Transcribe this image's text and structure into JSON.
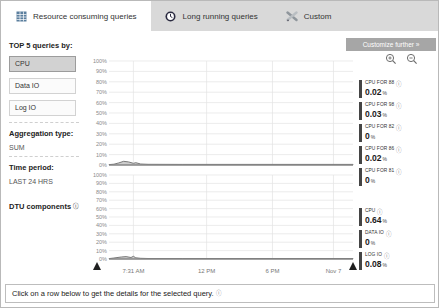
{
  "tabs": [
    {
      "label": "Resource consuming queries",
      "icon": "grid-icon",
      "active": true
    },
    {
      "label": "Long running queries",
      "icon": "clock-icon",
      "active": false
    },
    {
      "label": "Custom",
      "icon": "tools-icon",
      "active": false
    }
  ],
  "toolbar": {
    "customize_label": "Customize further »",
    "zoom_in_icon": "zoom-in-magnifier",
    "zoom_out_icon": "zoom-out-magnifier"
  },
  "sidebar": {
    "top5_label": "TOP 5 queries by:",
    "metric_buttons": [
      {
        "label": "CPU",
        "selected": true
      },
      {
        "label": "Data IO",
        "selected": false
      },
      {
        "label": "Log IO",
        "selected": false
      }
    ],
    "aggregation_label": "Aggregation type:",
    "aggregation_value": "SUM",
    "time_period_label": "Time period:",
    "time_period_value": "LAST 24 HRS",
    "dtu_label": "DTU components"
  },
  "legend_top": [
    {
      "name": "CPU FOR 88",
      "value": "0.02",
      "unit": "%"
    },
    {
      "name": "CPU FOR 98",
      "value": "0.03",
      "unit": "%"
    },
    {
      "name": "CPU FOR 82",
      "value": "0",
      "unit": "%"
    },
    {
      "name": "CPU FOR 86",
      "value": "0.02",
      "unit": "%"
    },
    {
      "name": "CPU FOR 81",
      "value": "0",
      "unit": "%"
    }
  ],
  "legend_bottom": [
    {
      "name": "CPU",
      "value": "0.64",
      "unit": "%"
    },
    {
      "name": "DATA IO",
      "value": "0",
      "unit": "%"
    },
    {
      "name": "LOG IO",
      "value": "0.08",
      "unit": "%"
    }
  ],
  "footer": {
    "message": "Click on a row below to get the details for the selected query."
  },
  "colors": {
    "tab_strip": "#d9d9d9",
    "selected_button": "#d2d2d2",
    "customize_button": "#a6a6a6",
    "legend_bar": "#454545",
    "chart_area_fill": "#cccccc",
    "chart_line": "#6e6e6e",
    "gridline": "#e4e4e4"
  },
  "chart_data": [
    {
      "type": "area",
      "title": "Top 5 queries by CPU (aggregated %, last 24 hrs)",
      "ylabel": "%",
      "ylim": [
        0,
        100
      ],
      "grid": true,
      "legend_position": "right",
      "y_ticks": [
        "100%",
        "90%",
        "80%",
        "70%",
        "60%",
        "50%",
        "40%",
        "30%",
        "20%",
        "10%",
        "0%"
      ],
      "x_ticks": [
        "7:31 AM",
        "12 PM",
        "6 PM",
        "Nov 7"
      ],
      "x_tick_fractions": [
        0.1,
        0.4,
        0.67,
        0.92
      ],
      "series": [
        {
          "name": "CPU FOR 88",
          "total_pct": 0.02
        },
        {
          "name": "CPU FOR 98",
          "total_pct": 0.03
        },
        {
          "name": "CPU FOR 82",
          "total_pct": 0
        },
        {
          "name": "CPU FOR 86",
          "total_pct": 0.02
        },
        {
          "name": "CPU FOR 81",
          "total_pct": 0
        }
      ],
      "profile_x": [
        0,
        0.02,
        0.04,
        0.06,
        0.08,
        0.1,
        0.11,
        0.13,
        0.16,
        0.3,
        1
      ],
      "profile_y": [
        0.4,
        0.8,
        2.0,
        3.6,
        3.0,
        1.6,
        2.2,
        1.0,
        0.7,
        0.6,
        0.6
      ]
    },
    {
      "type": "area",
      "title": "DTU components (%)",
      "ylabel": "%",
      "ylim": [
        0,
        100
      ],
      "grid": true,
      "legend_position": "right",
      "y_ticks": [
        "100%",
        "90%",
        "80%",
        "70%",
        "60%",
        "50%",
        "40%",
        "30%",
        "20%",
        "10%",
        "0%"
      ],
      "x_ticks": [
        "7:31 AM",
        "12 PM",
        "6 PM",
        "Nov 7"
      ],
      "x_tick_fractions": [
        0.1,
        0.4,
        0.67,
        0.92
      ],
      "series": [
        {
          "name": "CPU",
          "total_pct": 0.64
        },
        {
          "name": "DATA IO",
          "total_pct": 0
        },
        {
          "name": "LOG IO",
          "total_pct": 0.08
        }
      ],
      "profile_x": [
        0,
        0.02,
        0.05,
        0.07,
        0.09,
        0.1,
        0.11,
        0.13,
        0.16,
        0.3,
        1
      ],
      "profile_y": [
        0.5,
        1.2,
        2.4,
        2.8,
        1.8,
        3.2,
        1.4,
        0.8,
        0.6,
        0.6,
        0.6
      ]
    }
  ]
}
